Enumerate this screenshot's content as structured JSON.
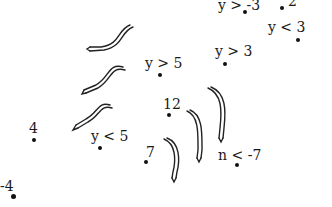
{
  "points": [
    {
      "id": "p1",
      "label": "y > -3",
      "x": 245,
      "y": 12,
      "lx": 218,
      "ly": -2
    },
    {
      "id": "p2",
      "label": "2",
      "x": 282,
      "y": 8,
      "lx": 288,
      "ly": -6
    },
    {
      "id": "p3",
      "label": "y < 3",
      "x": 298,
      "y": 40,
      "lx": 268,
      "ly": 20
    },
    {
      "id": "p4",
      "label": "y > 3",
      "x": 225,
      "y": 64,
      "lx": 215,
      "ly": 44
    },
    {
      "id": "p5",
      "label": "y > 5",
      "x": 159,
      "y": 74,
      "lx": 145,
      "ly": 56
    },
    {
      "id": "p6",
      "label": "12",
      "x": 168,
      "y": 114,
      "lx": 163,
      "ly": 97
    },
    {
      "id": "p7",
      "label": "4",
      "x": 33,
      "y": 139,
      "lx": 29,
      "ly": 121
    },
    {
      "id": "p8",
      "label": "y < 5",
      "x": 99,
      "y": 147,
      "lx": 91,
      "ly": 129
    },
    {
      "id": "p9",
      "label": "7",
      "x": 146,
      "y": 161,
      "lx": 146,
      "ly": 145
    },
    {
      "id": "p10",
      "label": "n < -7",
      "x": 236,
      "y": 164,
      "lx": 218,
      "ly": 148
    },
    {
      "id": "p11",
      "label": "-4",
      "x": 13,
      "y": 196,
      "lx": 0,
      "ly": 179
    }
  ],
  "arrows": [
    {
      "id": "a1",
      "direction": "left-down",
      "x": 88,
      "y": 26
    },
    {
      "id": "a2",
      "direction": "left-down",
      "x": 82,
      "y": 66
    },
    {
      "id": "a3",
      "direction": "left-down",
      "x": 73,
      "y": 105
    },
    {
      "id": "a4",
      "direction": "down",
      "x": 207,
      "y": 88
    },
    {
      "id": "a5",
      "direction": "down",
      "x": 187,
      "y": 110
    },
    {
      "id": "a6",
      "direction": "down",
      "x": 164,
      "y": 138
    }
  ]
}
